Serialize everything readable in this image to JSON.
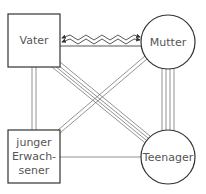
{
  "diagram": {
    "type": "family-genogram-relationship-diagram",
    "nodes": [
      {
        "id": "vater",
        "label": "Vater",
        "shape": "square"
      },
      {
        "id": "mutter",
        "label": "Mutter",
        "shape": "circle"
      },
      {
        "id": "junger",
        "label_lines": [
          "junger",
          "Erwach-",
          "sener"
        ],
        "shape": "square"
      },
      {
        "id": "teenager",
        "label": "Teenager",
        "shape": "circle"
      }
    ],
    "edges": [
      {
        "from": "vater",
        "to": "mutter",
        "type": "conflict",
        "style": "zigzag-double-arrow"
      },
      {
        "from": "vater",
        "to": "mutter",
        "type": "distant",
        "style": "single-line"
      },
      {
        "from": "vater",
        "to": "junger",
        "type": "close",
        "style": "double-line"
      },
      {
        "from": "vater",
        "to": "teenager",
        "type": "very-close",
        "style": "quadruple-line"
      },
      {
        "from": "mutter",
        "to": "teenager",
        "type": "very-close",
        "style": "quadruple-line"
      },
      {
        "from": "junger",
        "to": "mutter",
        "type": "close",
        "style": "double-line"
      },
      {
        "from": "junger",
        "to": "teenager",
        "type": "distant",
        "style": "single-line"
      }
    ]
  }
}
